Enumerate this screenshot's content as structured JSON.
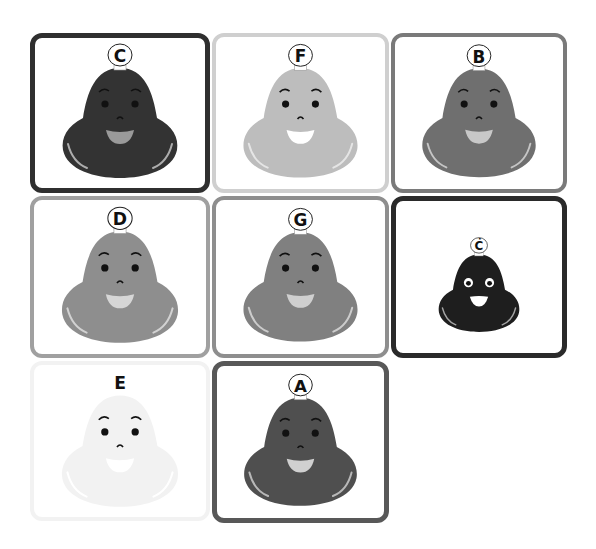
{
  "grid": {
    "tiles": [
      {
        "id": "C",
        "label": "C",
        "x": 30,
        "y": 33,
        "w": 180,
        "h": 160,
        "border_color": "#2f2f2f",
        "border_width": 5,
        "face_color": "#333333",
        "mouth_color": "#9a9a9a",
        "label_circle": true,
        "scale": 1.0,
        "white_eyes": false
      },
      {
        "id": "F",
        "label": "F",
        "x": 212,
        "y": 33,
        "w": 177,
        "h": 160,
        "border_color": "#cfcfcf",
        "border_width": 4,
        "face_color": "#bdbdbd",
        "mouth_color": "#ffffff",
        "label_circle": true,
        "scale": 1.0,
        "white_eyes": false
      },
      {
        "id": "B",
        "label": "B",
        "x": 391,
        "y": 33,
        "w": 176,
        "h": 160,
        "border_color": "#7a7a7a",
        "border_width": 4,
        "face_color": "#6f6f6f",
        "mouth_color": "#c8c8c8",
        "label_circle": true,
        "scale": 1.0,
        "white_eyes": false
      },
      {
        "id": "D",
        "label": "D",
        "x": 30,
        "y": 196,
        "w": 180,
        "h": 162,
        "border_color": "#a0a0a0",
        "border_width": 4,
        "face_color": "#8e8e8e",
        "mouth_color": "#d6d6d6",
        "label_circle": true,
        "scale": 1.0,
        "white_eyes": false
      },
      {
        "id": "G",
        "label": "G",
        "x": 212,
        "y": 196,
        "w": 177,
        "h": 162,
        "border_color": "#8e8e8e",
        "border_width": 4,
        "face_color": "#808080",
        "mouth_color": "#cfcfcf",
        "label_circle": true,
        "scale": 1.0,
        "white_eyes": false
      },
      {
        "id": "C-dot",
        "label": "Ċ",
        "x": 391,
        "y": 196,
        "w": 176,
        "h": 162,
        "border_color": "#2a2a2a",
        "border_width": 5,
        "face_color": "#1e1e1e",
        "mouth_color": "#ffffff",
        "label_circle": true,
        "scale": 0.72,
        "white_eyes": true
      },
      {
        "id": "E",
        "label": "E",
        "x": 30,
        "y": 361,
        "w": 180,
        "h": 160,
        "border_color": "#f2f2f2",
        "border_width": 4,
        "face_color": "#f2f2f2",
        "mouth_color": "#ffffff",
        "label_circle": false,
        "scale": 1.0,
        "white_eyes": false
      },
      {
        "id": "A",
        "label": "A",
        "x": 212,
        "y": 361,
        "w": 177,
        "h": 162,
        "border_color": "#585858",
        "border_width": 5,
        "face_color": "#4f4f4f",
        "mouth_color": "#d0d0d0",
        "label_circle": true,
        "scale": 1.0,
        "white_eyes": false
      }
    ]
  }
}
